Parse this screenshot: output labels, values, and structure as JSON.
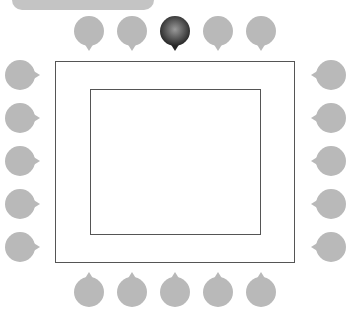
{
  "colors": {
    "pin_default": "#b9b9b9",
    "pin_selected_dark": "#262626",
    "pin_selected_light": "#9a9a9a",
    "frame_stroke": "#555555",
    "top_bar": "#c4c4c4"
  },
  "top_bar": {
    "icon": "tab-bar"
  },
  "pins": {
    "top": [
      {
        "id": "top-1",
        "x": 89,
        "selected": false
      },
      {
        "id": "top-2",
        "x": 132,
        "selected": false
      },
      {
        "id": "top-3",
        "x": 175,
        "selected": true
      },
      {
        "id": "top-4",
        "x": 218,
        "selected": false
      },
      {
        "id": "top-5",
        "x": 261,
        "selected": false
      }
    ],
    "left": [
      {
        "id": "left-1",
        "y": 75
      },
      {
        "id": "left-2",
        "y": 118
      },
      {
        "id": "left-3",
        "y": 161
      },
      {
        "id": "left-4",
        "y": 204
      },
      {
        "id": "left-5",
        "y": 247
      }
    ],
    "right": [
      {
        "id": "right-1",
        "y": 75
      },
      {
        "id": "right-2",
        "y": 118
      },
      {
        "id": "right-3",
        "y": 161
      },
      {
        "id": "right-4",
        "y": 204
      },
      {
        "id": "right-5",
        "y": 247
      }
    ],
    "bottom": [
      {
        "id": "bottom-1",
        "x": 89
      },
      {
        "id": "bottom-2",
        "x": 132
      },
      {
        "id": "bottom-3",
        "x": 175
      },
      {
        "id": "bottom-4",
        "x": 218
      },
      {
        "id": "bottom-5",
        "x": 261
      }
    ]
  }
}
